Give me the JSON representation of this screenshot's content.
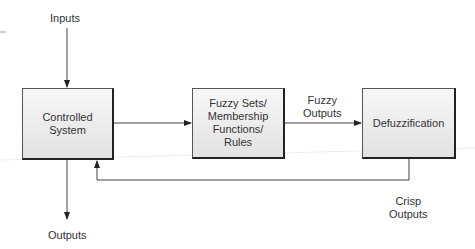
{
  "diagram": {
    "blocks": {
      "controlled_system": "Controlled\nSystem",
      "fuzzy_sets": "Fuzzy Sets/\nMembership\nFunctions/\nRules",
      "defuzzification": "Defuzzification"
    },
    "labels": {
      "inputs": "Inputs",
      "outputs": "Outputs",
      "fuzzy_outputs": "Fuzzy\nOutputs",
      "crisp_outputs": "Crisp\nOutputs"
    },
    "edges": [
      {
        "from": "Inputs",
        "to": "Controlled System"
      },
      {
        "from": "Controlled System",
        "to": "Fuzzy Sets/Membership Functions/Rules"
      },
      {
        "from": "Fuzzy Sets/Membership Functions/Rules",
        "to": "Defuzzification",
        "label": "Fuzzy Outputs"
      },
      {
        "from": "Defuzzification",
        "to": "Controlled System",
        "label": "Crisp Outputs"
      },
      {
        "from": "Controlled System",
        "to": "Outputs"
      }
    ]
  }
}
